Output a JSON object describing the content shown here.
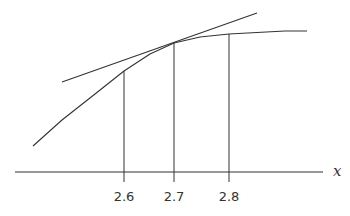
{
  "diagram": {
    "type": "tangent-line-illustration",
    "axis": {
      "label": "x",
      "ticks": [
        "2.6",
        "2.7",
        "2.8"
      ]
    },
    "elements": {
      "curve": "concave-down increasing curve",
      "tangent_line": "line tangent to curve at x = 2.7",
      "vertical_lines": [
        "x = 2.6",
        "x = 2.7",
        "x = 2.8"
      ]
    },
    "colors": {
      "line": "#333333",
      "background": "#ffffff"
    }
  }
}
